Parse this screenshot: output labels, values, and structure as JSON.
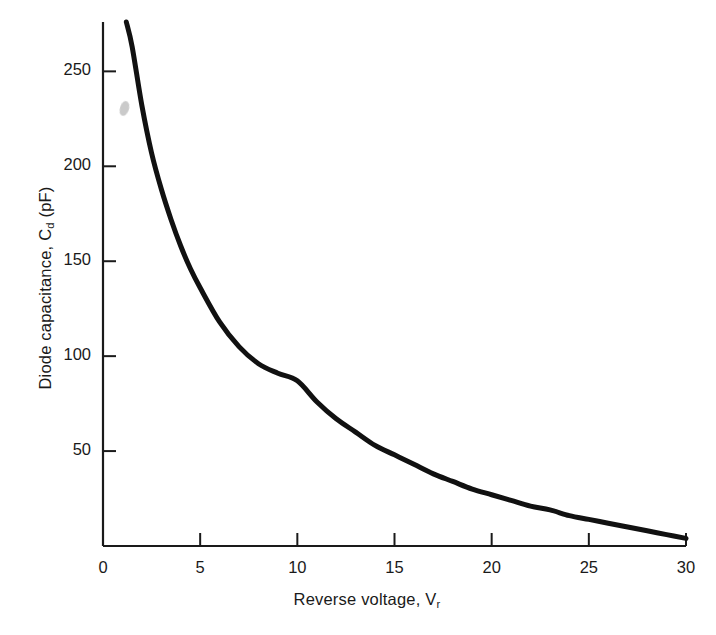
{
  "chart_data": {
    "type": "line",
    "title": "",
    "subtitle": "",
    "xlabel": "Reverse voltage, V",
    "xlabel_sub": "r",
    "ylabel": "Diode capacitance, C",
    "ylabel_sub": "d",
    "ylabel_units": " (pF)",
    "xlim": [
      0,
      30
    ],
    "ylim": [
      0,
      276
    ],
    "grid": false,
    "legend": "none",
    "xticks": [
      0,
      5,
      10,
      15,
      20,
      25,
      30
    ],
    "xtick_labels": [
      "0",
      "5",
      "10",
      "15",
      "20",
      "25",
      "30"
    ],
    "yticks": [
      0,
      50,
      100,
      150,
      200,
      250
    ],
    "ytick_labels": [
      "0",
      "50",
      "100",
      "150",
      "200",
      "250"
    ],
    "series": [
      {
        "name": "Diode capacitance",
        "color": "#111111",
        "linewidth": 5,
        "x": [
          1.2,
          1.5,
          2,
          2.5,
          3,
          3.5,
          4,
          4.5,
          5,
          6,
          7,
          8,
          9,
          10,
          11,
          12,
          13,
          14,
          15,
          16,
          17,
          18,
          19,
          20,
          21,
          22,
          23,
          24,
          25,
          26,
          27,
          28,
          29,
          30
        ],
        "y": [
          276,
          263,
          232,
          207,
          188,
          172,
          158,
          146,
          136,
          118,
          105,
          96,
          91,
          87,
          76,
          67,
          60,
          53,
          48,
          43,
          38,
          34,
          30,
          27,
          24,
          21,
          19,
          16,
          14,
          12,
          10,
          8,
          6,
          4
        ]
      }
    ],
    "annotations": [
      {
        "name": "scan-artifact-smudge",
        "kind": "smudge",
        "x_px": 124,
        "y_px": 108,
        "color": "#b9b9b9"
      }
    ],
    "axis_color": "#1a1a1a",
    "background_color": "#ffffff"
  },
  "geometry": {
    "plot_left_px": 103,
    "plot_right_px": 686,
    "plot_top_px": 22,
    "plot_bottom_px": 546
  }
}
